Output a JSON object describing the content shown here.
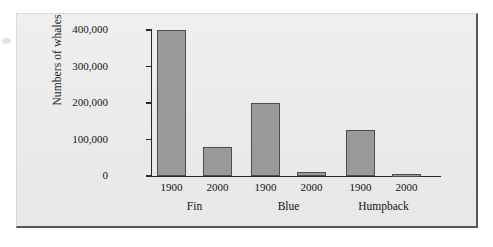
{
  "figure": {
    "background_color": "#ececec",
    "page_background_color": "#ffffff",
    "border_color": "#55575a"
  },
  "chart_data": {
    "type": "bar",
    "title": "",
    "subtitle": "",
    "xlabel": "",
    "ylabel": "Numbers of whales",
    "ylim": [
      0,
      400000
    ],
    "yticks": [
      0,
      100000,
      200000,
      300000,
      400000
    ],
    "ytick_labels": [
      "0",
      "100,000",
      "200,000",
      "300,000",
      "400,000"
    ],
    "grid": false,
    "legend": null,
    "categories": [
      "Fin",
      "Blue",
      "Humpback"
    ],
    "group_labels": [
      "1900",
      "2000"
    ],
    "series": [
      {
        "name": "1900",
        "values": [
          400000,
          200000,
          125000
        ]
      },
      {
        "name": "2000",
        "values": [
          80000,
          10000,
          5000
        ]
      }
    ],
    "bar_fill_color": "#9a9a9a",
    "bar_edge_color": "#4d4d4d",
    "axis_color": "#2a2a2a",
    "bars": [
      {
        "category": "Fin",
        "year": "1900",
        "value": 400000
      },
      {
        "category": "Fin",
        "year": "2000",
        "value": 80000
      },
      {
        "category": "Blue",
        "year": "1900",
        "value": 200000
      },
      {
        "category": "Blue",
        "year": "2000",
        "value": 10000
      },
      {
        "category": "Humpback",
        "year": "1900",
        "value": 125000
      },
      {
        "category": "Humpback",
        "year": "2000",
        "value": 5000
      }
    ]
  }
}
